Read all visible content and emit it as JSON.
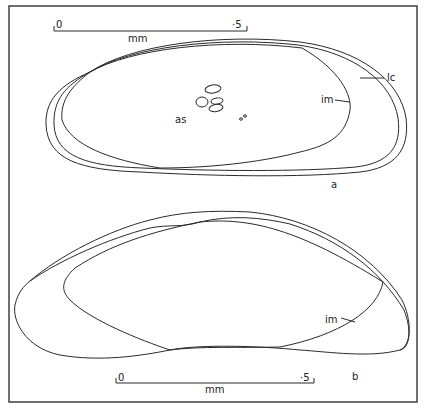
{
  "figure": {
    "panels": [
      {
        "id": "a",
        "label": "a",
        "scale_bar": {
          "start": "0",
          "end": "·5",
          "unit": "mm"
        },
        "annotations": {
          "lc": "lc",
          "im": "im",
          "as": "as"
        }
      },
      {
        "id": "b",
        "label": "b",
        "scale_bar": {
          "start": "0",
          "end": "·5",
          "unit": "mm"
        },
        "annotations": {
          "im": "im"
        }
      }
    ],
    "colors": {
      "line": "#2a2a2a",
      "background": "#ffffff",
      "frame": "#333333"
    }
  }
}
